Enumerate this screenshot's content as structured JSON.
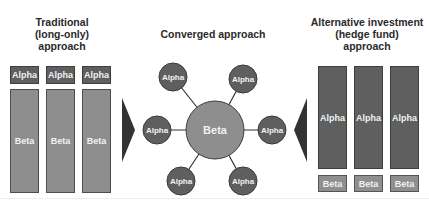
{
  "titles": {
    "left": [
      "Traditional",
      "(long-only)",
      "approach"
    ],
    "center": "Converged approach",
    "right": [
      "Alternative investment",
      "(hedge fund)",
      "approach"
    ]
  },
  "left_panel": {
    "alpha_labels": [
      "Alpha",
      "Alpha",
      "Alpha"
    ],
    "beta_labels": [
      "Beta",
      "Beta",
      "Beta"
    ]
  },
  "center_panel": {
    "hub_label": "Beta",
    "spoke_labels": [
      "Alpha",
      "Alpha",
      "Alpha",
      "Alpha",
      "Alpha",
      "Alpha"
    ]
  },
  "right_panel": {
    "alpha_labels": [
      "Alpha",
      "Alpha",
      "Alpha"
    ],
    "beta_labels": [
      "Beta",
      "Beta",
      "Beta"
    ]
  },
  "colors": {
    "alpha": "#5f5f5f",
    "beta": "#8e8e8e",
    "arrow": "#333333",
    "title_text": "#2a2a2a"
  }
}
